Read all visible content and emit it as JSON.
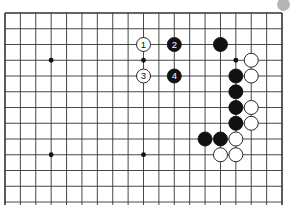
{
  "board": {
    "cols": 19,
    "rows": 13,
    "origin_x": 5,
    "origin_y": 13,
    "spacing_x": 15.39,
    "spacing_y": 15.75,
    "open_bottom": true,
    "line_color": "#333333",
    "stone_radius": 7,
    "star_points": [
      [
        3,
        3
      ],
      [
        9,
        3
      ],
      [
        15,
        3
      ],
      [
        3,
        9
      ],
      [
        9,
        9
      ]
    ],
    "stones": [
      {
        "col": 9,
        "row": 2,
        "color": "white",
        "label": "1"
      },
      {
        "col": 11,
        "row": 2,
        "color": "black",
        "label": "2"
      },
      {
        "col": 9,
        "row": 4,
        "color": "white",
        "label": "3"
      },
      {
        "col": 11,
        "row": 4,
        "color": "black",
        "label": "4"
      },
      {
        "col": 14,
        "row": 2,
        "color": "black",
        "label": ""
      },
      {
        "col": 16,
        "row": 3,
        "color": "white",
        "label": ""
      },
      {
        "col": 15,
        "row": 4,
        "color": "black",
        "label": ""
      },
      {
        "col": 16,
        "row": 4,
        "color": "white",
        "label": ""
      },
      {
        "col": 15,
        "row": 5,
        "color": "black",
        "label": ""
      },
      {
        "col": 15,
        "row": 6,
        "color": "black",
        "label": ""
      },
      {
        "col": 16,
        "row": 6,
        "color": "white",
        "label": ""
      },
      {
        "col": 15,
        "row": 7,
        "color": "black",
        "label": ""
      },
      {
        "col": 16,
        "row": 7,
        "color": "white",
        "label": ""
      },
      {
        "col": 13,
        "row": 8,
        "color": "black",
        "label": ""
      },
      {
        "col": 14,
        "row": 8,
        "color": "black",
        "label": ""
      },
      {
        "col": 15,
        "row": 8,
        "color": "white",
        "label": ""
      },
      {
        "col": 14,
        "row": 9,
        "color": "white",
        "label": ""
      },
      {
        "col": 15,
        "row": 9,
        "color": "white",
        "label": ""
      }
    ]
  },
  "corner_marker": {
    "color": "#b5b5b5"
  }
}
